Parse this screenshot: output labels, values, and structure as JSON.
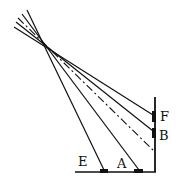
{
  "diagram": {
    "type": "optics-ray-diagram",
    "labels": {
      "E": "E",
      "A": "A",
      "B": "B",
      "F": "F"
    },
    "colors": {
      "line": "#111111",
      "background": "#ffffff"
    }
  }
}
